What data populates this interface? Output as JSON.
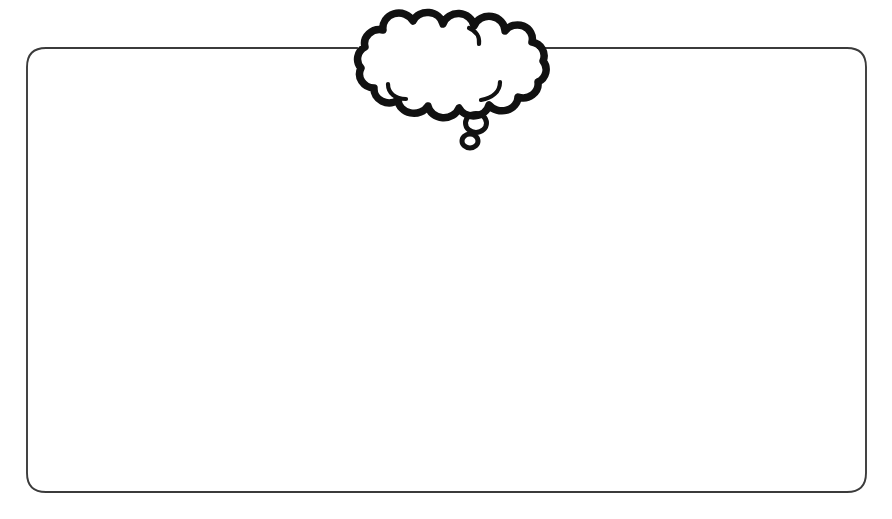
{
  "canvas": {
    "width": 892,
    "height": 519,
    "background_color": "#ffffff",
    "description": "blank-worksheet-template"
  },
  "frame": {
    "name": "rounded-rectangle-border",
    "stroke_color": "#3b3b3b",
    "fill_color": "#ffffff",
    "x": 27,
    "y": 48,
    "width": 839,
    "height": 444,
    "corner_radius": 19,
    "stroke_width": 1.9
  },
  "thought_bubble": {
    "name": "thought-bubble-cloud",
    "stroke_color": "#111111",
    "fill_color": "#ffffff",
    "bounds": {
      "x": 357,
      "y": 17,
      "width": 189,
      "height": 97
    },
    "lobe_count": 13,
    "tail": {
      "name": "thought-bubble-tail",
      "circles": [
        {
          "cx": 476,
          "cy": 123,
          "rx": 11,
          "ry": 10
        },
        {
          "cx": 470,
          "cy": 141,
          "rx": 8,
          "ry": 7
        }
      ]
    },
    "text": ""
  },
  "content": {
    "caption": "",
    "placeholder": ""
  }
}
